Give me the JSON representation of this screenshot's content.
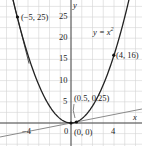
{
  "chart_data": {
    "type": "line",
    "title": "",
    "xlabel": "x",
    "ylabel": "y",
    "xlim": [
      -6.6,
      6.6
    ],
    "ylim": [
      -5.0,
      29.0
    ],
    "grid": true,
    "x_ticks": [
      -4,
      0,
      4
    ],
    "x_tick_labels": [
      "−4",
      "0",
      "4"
    ],
    "y_ticks": [
      5,
      10,
      15,
      20,
      25
    ],
    "y_tick_labels": [
      "5",
      "10",
      "15",
      "20",
      "25"
    ],
    "series": [
      {
        "name": "y = x^2",
        "kind": "curve",
        "function": "x^2",
        "x_range": [
          -5.4,
          5.4
        ],
        "color": "#222222"
      },
      {
        "name": "tangent at (-5, 25)",
        "kind": "line",
        "slope": -10,
        "intercept": -25,
        "x_range": [
          -5.5,
          -3.9
        ],
        "color": "#555555"
      },
      {
        "name": "secant through (0,0) and (0.5, 0.25)",
        "kind": "line",
        "slope": 0.5,
        "intercept": 0,
        "x_range": [
          -6.6,
          6.6
        ],
        "color": "#777777"
      }
    ],
    "points": [
      {
        "x": -5,
        "y": 25,
        "label": "(−5, 25)"
      },
      {
        "x": 4,
        "y": 16,
        "label": "(4, 16)"
      },
      {
        "x": 0.5,
        "y": 0.25,
        "label": "(0.5, 0.25)"
      },
      {
        "x": 0,
        "y": 0,
        "label": "(0, 0)"
      }
    ],
    "annotations": [
      {
        "text": "y = x²",
        "x": 1.6,
        "y": 20
      }
    ]
  },
  "labels": {
    "x_axis": "x",
    "y_axis": "y",
    "curve": "y = x",
    "curve_exp": "2",
    "pt_m5": "(−5, 25)",
    "pt_4": "(4, 16)",
    "pt_05": "(0.5, 0.25)",
    "pt_0": "(0, 0)",
    "tick_xm4": "−4",
    "tick_x0": "0",
    "tick_x4": "4",
    "tick_y5": "5",
    "tick_y10": "10",
    "tick_y15": "15",
    "tick_y20": "20",
    "tick_y25": "25"
  }
}
